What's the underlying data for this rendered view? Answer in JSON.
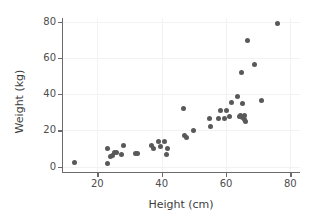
{
  "chart_data": {
    "type": "scatter",
    "title": "",
    "xlabel": "Height (cm)",
    "ylabel": "Weight (kg)",
    "xlim": [
      9,
      83
    ],
    "ylim": [
      -3,
      82
    ],
    "xticks": [
      20,
      40,
      60,
      80
    ],
    "yticks": [
      0,
      20,
      40,
      60,
      80
    ],
    "grid": true,
    "legend": null,
    "marker_color": "#595959",
    "marker_size": 5,
    "points": [
      {
        "x": 13.0,
        "y": 2.0
      },
      {
        "x": 23.0,
        "y": 9.8
      },
      {
        "x": 23.2,
        "y": 1.8
      },
      {
        "x": 24.2,
        "y": 5.8
      },
      {
        "x": 24.8,
        "y": 6.2
      },
      {
        "x": 25.2,
        "y": 7.8
      },
      {
        "x": 26.0,
        "y": 8.0
      },
      {
        "x": 27.5,
        "y": 6.8
      },
      {
        "x": 28.2,
        "y": 11.8
      },
      {
        "x": 31.8,
        "y": 7.0
      },
      {
        "x": 32.6,
        "y": 7.0
      },
      {
        "x": 36.8,
        "y": 11.5
      },
      {
        "x": 37.6,
        "y": 10.0
      },
      {
        "x": 39.0,
        "y": 13.8
      },
      {
        "x": 39.6,
        "y": 11.0
      },
      {
        "x": 41.0,
        "y": 14.0
      },
      {
        "x": 41.4,
        "y": 6.8
      },
      {
        "x": 41.8,
        "y": 10.0
      },
      {
        "x": 46.8,
        "y": 31.8
      },
      {
        "x": 47.0,
        "y": 17.0
      },
      {
        "x": 47.6,
        "y": 16.0
      },
      {
        "x": 50.0,
        "y": 20.0
      },
      {
        "x": 55.0,
        "y": 26.6
      },
      {
        "x": 55.2,
        "y": 22.0
      },
      {
        "x": 57.6,
        "y": 26.4
      },
      {
        "x": 58.2,
        "y": 31.0
      },
      {
        "x": 59.6,
        "y": 26.8
      },
      {
        "x": 60.2,
        "y": 31.0
      },
      {
        "x": 61.2,
        "y": 27.4
      },
      {
        "x": 61.6,
        "y": 35.4
      },
      {
        "x": 63.6,
        "y": 38.8
      },
      {
        "x": 64.2,
        "y": 27.8
      },
      {
        "x": 64.6,
        "y": 28.2
      },
      {
        "x": 64.8,
        "y": 51.8
      },
      {
        "x": 65.0,
        "y": 34.6
      },
      {
        "x": 65.2,
        "y": 27.0
      },
      {
        "x": 65.6,
        "y": 26.0
      },
      {
        "x": 65.8,
        "y": 28.4
      },
      {
        "x": 66.0,
        "y": 24.8
      },
      {
        "x": 66.8,
        "y": 69.6
      },
      {
        "x": 68.8,
        "y": 56.6
      },
      {
        "x": 71.0,
        "y": 36.6
      },
      {
        "x": 76.0,
        "y": 79.0
      }
    ]
  }
}
